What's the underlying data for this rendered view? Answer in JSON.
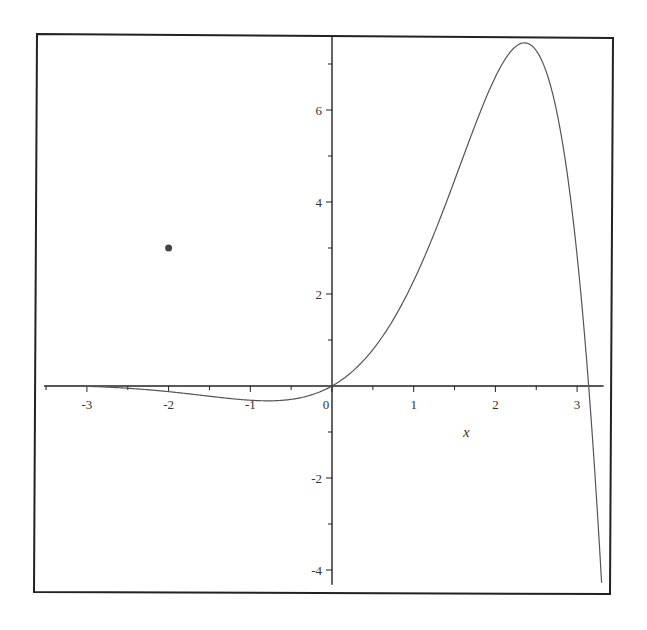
{
  "chart_data": {
    "type": "line",
    "title": "",
    "xlabel": "x",
    "ylabel": "",
    "function": "e^x * sin(x)",
    "xlim": [
      -3.5,
      3.3
    ],
    "ylim": [
      -4.3,
      7.5
    ],
    "grid": false,
    "legend": null,
    "x_ticks": [
      {
        "value": -3,
        "label": "-3"
      },
      {
        "value": -2,
        "label": "-2"
      },
      {
        "value": -1,
        "label": "-1"
      },
      {
        "value": 0,
        "label": "0"
      },
      {
        "value": 1,
        "label": "1"
      },
      {
        "value": 2,
        "label": "2"
      },
      {
        "value": 3,
        "label": "3"
      }
    ],
    "x_minor_ticks": [
      -3.5,
      -2.5,
      -1.5,
      -0.5,
      0.5,
      1.5,
      2.5
    ],
    "y_ticks": [
      {
        "value": 6,
        "label": "6"
      },
      {
        "value": 4,
        "label": "4"
      },
      {
        "value": 2,
        "label": "2"
      },
      {
        "value": -2,
        "label": "-2"
      },
      {
        "value": -4,
        "label": "-4"
      }
    ],
    "y_minor_ticks": [
      7,
      5,
      3,
      1,
      -1,
      -3
    ],
    "series": [
      {
        "name": "curve",
        "color": "#555555",
        "x": [
          -3.5,
          -3.0,
          -2.5,
          -2.0,
          -1.5,
          -1.0,
          -0.75,
          -0.5,
          -0.25,
          0.0,
          0.25,
          0.5,
          0.75,
          1.0,
          1.25,
          1.5,
          1.75,
          2.0,
          2.2,
          2.356,
          2.5,
          2.65,
          2.75,
          2.9,
          3.0,
          3.1,
          3.2,
          3.3
        ],
        "y": [
          0.011,
          -0.007,
          -0.049,
          -0.123,
          -0.223,
          -0.31,
          -0.322,
          -0.291,
          -0.193,
          0.0,
          0.318,
          0.79,
          1.443,
          2.287,
          3.312,
          4.471,
          5.663,
          6.719,
          7.297,
          7.46,
          7.29,
          6.62,
          5.97,
          4.45,
          2.835,
          0.923,
          -1.433,
          -4.276
        ]
      }
    ],
    "points": [
      {
        "x": -2,
        "y": 3,
        "color": "#444444",
        "label": ""
      }
    ]
  },
  "frame": {
    "border_color": "#222222",
    "axis_color": "#222222"
  }
}
